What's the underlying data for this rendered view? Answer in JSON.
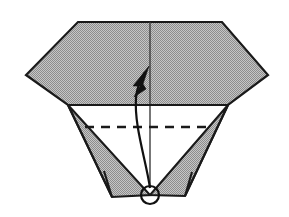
{
  "figure": {
    "background_color": "#ffffff",
    "line_color": "#1a1a1a",
    "paper_fill_color": "#a8a8a8",
    "paper_fill_pattern": "halftone-dither-gray",
    "center_crease_color": "#3d3d3d",
    "canvas": {
      "width": 289,
      "height": 217
    }
  },
  "geometry": {
    "hexagon_top": {
      "name": "upper-paper-body",
      "points": "78,22 222,22 268,75 228,105 68,105 26,75"
    },
    "left_flap": {
      "name": "left-triangular-flap",
      "points": "68,105 150,195 112,197"
    },
    "right_flap": {
      "name": "right-triangular-flap",
      "points": "228,105 185,196 150,195"
    },
    "left_flap_inner": {
      "name": "left-flap-inner-edge",
      "points": "68,105 112,197 104,171"
    },
    "right_flap_inner": {
      "name": "right-flap-inner-edge",
      "points": "228,105 185,196 192,172"
    },
    "horizontal_fold": {
      "name": "horizontal-fold-edge",
      "x1": 68,
      "y1": 105,
      "x2": 228,
      "y2": 105
    },
    "dashed_valley_fold": {
      "name": "dashed-valley-fold-line",
      "x1": 85,
      "y1": 127,
      "x2": 212,
      "y2": 127,
      "dash_pattern": "9 7"
    },
    "center_crease": {
      "name": "vertical-center-crease",
      "x1": 150,
      "y1": 22,
      "x2": 150,
      "y2": 186
    },
    "arrow": {
      "name": "fold-direction-arrow",
      "shaft_path": "M 150,188 C 146,160 134,126 136,98 C 137,86 141,78 145,72",
      "head_points": "149,66 133,86 140,86 134,97 146,89 143,84"
    },
    "rotation_circle": {
      "name": "rotation-indicator-circle",
      "cx": 150,
      "cy": 195,
      "r": 9
    }
  }
}
